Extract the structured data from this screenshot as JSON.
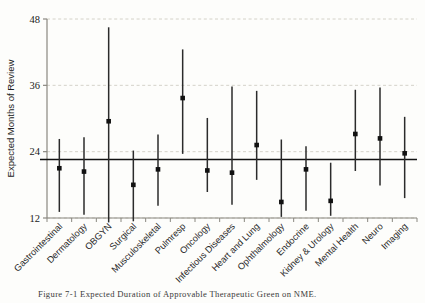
{
  "figure": {
    "caption": "Figure 7-1 Expected Duration of Approvable Therapeutic Green on NME."
  },
  "chart_data": {
    "type": "scatter",
    "title": "",
    "xlabel": "",
    "ylabel": "Expected Months of Review",
    "ylim": [
      12,
      48
    ],
    "yticks": [
      12,
      24,
      36,
      48
    ],
    "grid": true,
    "grid_axis": "y",
    "legend": false,
    "marker": "square",
    "errorbar_style": "vertical-line",
    "reference_line": {
      "label": "overall mean",
      "value": 22.6,
      "orientation": "horizontal"
    },
    "categories": [
      "Gastrointestinal",
      "Dermatology",
      "OBGYN",
      "Surgical",
      "Musculoskeletal",
      "Pulmresp",
      "Oncology",
      "Infectious Diseases",
      "Heart and Lung",
      "Ophthalmology",
      "Endocrine",
      "Kidney & Urology",
      "Mental Health",
      "Neuro",
      "Imaging"
    ],
    "values": [
      21.0,
      20.4,
      29.5,
      18.0,
      20.8,
      33.7,
      20.6,
      20.2,
      25.2,
      14.9,
      20.8,
      15.1,
      27.2,
      26.4,
      23.7
    ],
    "ci_low": [
      13.1,
      12.6,
      11.2,
      11.4,
      14.2,
      23.6,
      16.7,
      14.4,
      18.9,
      12.2,
      13.3,
      12.4,
      20.5,
      17.9,
      15.6
    ],
    "ci_high": [
      26.3,
      26.6,
      46.5,
      24.2,
      27.1,
      42.5,
      30.1,
      35.8,
      35.0,
      26.2,
      25.0,
      22.0,
      35.2,
      35.6,
      30.3
    ],
    "series_name": "Expected months of review"
  }
}
